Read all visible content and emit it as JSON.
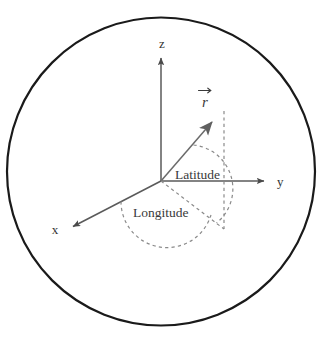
{
  "figure": {
    "background_color": "#ffffff"
  },
  "sphere": {
    "name": "sphere-outline",
    "center": {
      "x": 161,
      "y": 171.5
    },
    "radius": 154,
    "stroke_color": "#1a1a1a",
    "stroke_width": 2.2
  },
  "origin": {
    "x": 161,
    "y": 181
  },
  "axes": [
    {
      "id": "z",
      "label": "z",
      "label_x": 162,
      "label_y": 48,
      "tip": {
        "x": 161,
        "y": 54
      },
      "color": "#5a5a5a"
    },
    {
      "id": "y",
      "label": "y",
      "label_x": 277,
      "label_y": 186,
      "tip": {
        "x": 268,
        "y": 181
      },
      "color": "#5a5a5a"
    },
    {
      "id": "x",
      "label": "x",
      "label_x": 55,
      "label_y": 234,
      "tip": {
        "x": 68,
        "y": 228
      },
      "color": "#5a5a5a"
    }
  ],
  "vector": {
    "label": "r⃗",
    "label_plain": "r",
    "label_x": 205,
    "label_y": 105,
    "tip": {
      "x": 222,
      "y": 112
    },
    "color": "#6a6a6a",
    "arrow_color": "#5a5a5a"
  },
  "angles": [
    {
      "id": "latitude",
      "label": "Latitude",
      "label_x": 175,
      "label_y": 179,
      "color": "#707070"
    },
    {
      "id": "longitude",
      "label": "Longitude",
      "label_x": 133,
      "label_y": 217,
      "color": "#707070"
    }
  ],
  "guides": {
    "dashed_color": "#8a8a8a",
    "projection_point": {
      "x": 224,
      "y": 228
    }
  },
  "colors": {
    "outline": "#1a1a1a",
    "axis": "#5a5a5a",
    "vector": "#6a6a6a",
    "dashed": "#8a8a8a",
    "text": "#333333"
  }
}
